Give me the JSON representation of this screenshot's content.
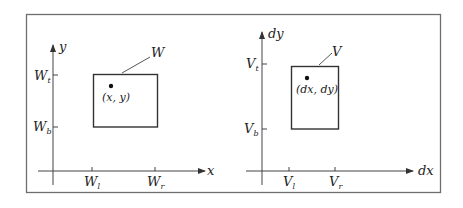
{
  "diagram": {
    "type": "window-to-viewport mapping",
    "frame": {
      "stroke": "#6e6e6e"
    },
    "left_panel": {
      "name": "world-window",
      "x_axis_label": "x",
      "y_axis_label": "y",
      "rect_label": "W",
      "point_label": "(x, y)",
      "ticks": {
        "top": {
          "base": "W",
          "sub": "t"
        },
        "bottom": {
          "base": "W",
          "sub": "b"
        },
        "left": {
          "base": "W",
          "sub": "l"
        },
        "right": {
          "base": "W",
          "sub": "r"
        }
      }
    },
    "right_panel": {
      "name": "device-viewport",
      "x_axis_label": "dx",
      "y_axis_label": "dy",
      "rect_label": "V",
      "point_label": "(dx, dy)",
      "ticks": {
        "top": {
          "base": "V",
          "sub": "t"
        },
        "bottom": {
          "base": "V",
          "sub": "b"
        },
        "left": {
          "base": "V",
          "sub": "l"
        },
        "right": {
          "base": "V",
          "sub": "r"
        }
      }
    }
  }
}
